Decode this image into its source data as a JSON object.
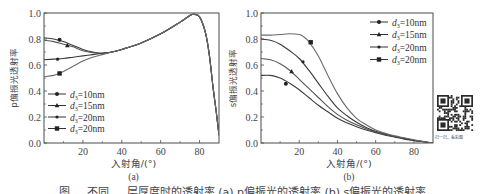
{
  "figure_caption": "图 ... 不同 ... 层厚度时的透射率 (a) p偏振光的透射率 (b) s偏振光的透射率",
  "qr": {
    "caption": "扫一扫，看彩图"
  },
  "chart_data": [
    {
      "type": "line",
      "panel_label": "(a)",
      "title": "",
      "xlabel": "入射角/(°)",
      "ylabel": "p偏振光透射率",
      "xlim": [
        0,
        90
      ],
      "ylim": [
        0,
        1.0
      ],
      "xticks": [
        20,
        40,
        60,
        80
      ],
      "yticks": [
        0.0,
        0.2,
        0.4,
        0.6,
        0.8,
        1.0
      ],
      "ytick_labels": [
        "0.0",
        "0.2",
        "0.4",
        "0.6",
        "0.8",
        "1.0"
      ],
      "grid": false,
      "legend_position": "lower-left",
      "series": [
        {
          "name": "d3=10nm",
          "legend_sub": "3",
          "legend_value": "=10nm",
          "marker": "circle",
          "x": [
            0,
            5,
            10,
            15,
            20,
            25,
            30,
            35,
            40,
            50,
            60,
            70,
            75,
            77,
            80,
            83,
            85,
            87,
            88.5,
            90
          ],
          "y": [
            0.81,
            0.8,
            0.78,
            0.75,
            0.72,
            0.7,
            0.69,
            0.7,
            0.72,
            0.77,
            0.84,
            0.93,
            0.98,
            0.99,
            0.97,
            0.85,
            0.68,
            0.42,
            0.25,
            0.06
          ],
          "marker_at": [
            8,
            0.795
          ]
        },
        {
          "name": "d3=15nm",
          "legend_sub": "3",
          "legend_value": "=15nm",
          "marker": "triangle",
          "x": [
            0,
            5,
            10,
            15,
            20,
            25,
            30,
            35,
            40,
            50,
            60,
            70,
            75,
            77,
            80,
            83,
            85,
            87,
            88.5,
            90
          ],
          "y": [
            0.79,
            0.78,
            0.76,
            0.74,
            0.71,
            0.695,
            0.69,
            0.7,
            0.72,
            0.77,
            0.84,
            0.93,
            0.98,
            0.99,
            0.97,
            0.85,
            0.68,
            0.42,
            0.25,
            0.06
          ],
          "marker_at": [
            12,
            0.75
          ]
        },
        {
          "name": "d3=20nm",
          "legend_sub": "3",
          "legend_value": "=20nm",
          "marker": "dot",
          "x": [
            0,
            5,
            10,
            15,
            20,
            25,
            30,
            35,
            40,
            50,
            60,
            70,
            75,
            77,
            80,
            83,
            85,
            87,
            88.5,
            90
          ],
          "y": [
            0.64,
            0.645,
            0.65,
            0.66,
            0.67,
            0.68,
            0.69,
            0.7,
            0.72,
            0.77,
            0.84,
            0.93,
            0.98,
            0.99,
            0.97,
            0.85,
            0.68,
            0.42,
            0.25,
            0.06
          ],
          "marker_at": [
            7,
            0.645
          ]
        },
        {
          "name": "d3=20nm",
          "legend_sub": "3",
          "legend_value": "=20nm",
          "marker": "square",
          "x": [
            0,
            5,
            10,
            15,
            20,
            25,
            30,
            35,
            40,
            50,
            60,
            70,
            75,
            77,
            80,
            83,
            85,
            87,
            88.5,
            90
          ],
          "y": [
            0.51,
            0.52,
            0.55,
            0.59,
            0.63,
            0.66,
            0.68,
            0.7,
            0.72,
            0.77,
            0.84,
            0.93,
            0.98,
            0.99,
            0.97,
            0.85,
            0.68,
            0.42,
            0.25,
            0.06
          ],
          "marker_at": [
            8,
            0.535
          ]
        }
      ]
    },
    {
      "type": "line",
      "panel_label": "(b)",
      "title": "",
      "xlabel": "入射角/(°)",
      "ylabel": "s偏振光透射率",
      "xlim": [
        0,
        90
      ],
      "ylim": [
        0,
        1.0
      ],
      "xticks": [
        20,
        40,
        60,
        80
      ],
      "yticks": [
        0.0,
        0.2,
        0.4,
        0.6,
        0.8,
        1.0
      ],
      "ytick_labels": [
        "0.0",
        "0.2",
        "0.4",
        "0.6",
        "0.8",
        "1.0"
      ],
      "grid": false,
      "legend_position": "upper-right",
      "series": [
        {
          "name": "d3=10nm",
          "legend_sub": "3",
          "legend_value": "=10nm",
          "marker": "circle",
          "x": [
            0,
            5,
            10,
            15,
            20,
            25,
            30,
            35,
            40,
            45,
            50,
            55,
            60,
            65,
            70,
            75,
            80,
            85,
            90
          ],
          "y": [
            0.52,
            0.52,
            0.5,
            0.46,
            0.41,
            0.35,
            0.29,
            0.24,
            0.19,
            0.155,
            0.125,
            0.1,
            0.08,
            0.06,
            0.045,
            0.03,
            0.02,
            0.01,
            0.0
          ],
          "marker_at": [
            13,
            0.455
          ]
        },
        {
          "name": "d3=15nm",
          "legend_sub": "3",
          "legend_value": "=15nm",
          "marker": "triangle",
          "x": [
            0,
            5,
            10,
            15,
            20,
            25,
            30,
            35,
            40,
            45,
            50,
            55,
            60,
            65,
            70,
            75,
            80,
            85,
            90
          ],
          "y": [
            0.65,
            0.64,
            0.61,
            0.56,
            0.49,
            0.42,
            0.35,
            0.28,
            0.22,
            0.175,
            0.14,
            0.11,
            0.085,
            0.065,
            0.05,
            0.035,
            0.02,
            0.01,
            0.0
          ],
          "marker_at": [
            16,
            0.55
          ]
        },
        {
          "name": "d3=20nm",
          "legend_sub": "3",
          "legend_value": "=20nm",
          "marker": "dot",
          "x": [
            0,
            5,
            10,
            15,
            20,
            25,
            30,
            35,
            40,
            45,
            50,
            55,
            60,
            65,
            70,
            75,
            80,
            85,
            90
          ],
          "y": [
            0.8,
            0.79,
            0.76,
            0.71,
            0.65,
            0.56,
            0.46,
            0.36,
            0.27,
            0.21,
            0.16,
            0.12,
            0.09,
            0.07,
            0.05,
            0.035,
            0.02,
            0.01,
            0.0
          ],
          "marker_at": [
            22,
            0.625
          ]
        },
        {
          "name": "d3=20nm",
          "legend_sub": "3",
          "legend_value": "=20nm",
          "marker": "square",
          "x": [
            0,
            5,
            10,
            15,
            20,
            22,
            25,
            30,
            35,
            40,
            45,
            50,
            55,
            60,
            65,
            70,
            75,
            80,
            85,
            90
          ],
          "y": [
            0.83,
            0.83,
            0.835,
            0.84,
            0.835,
            0.82,
            0.78,
            0.67,
            0.52,
            0.38,
            0.27,
            0.19,
            0.14,
            0.1,
            0.075,
            0.055,
            0.04,
            0.025,
            0.012,
            0.0
          ],
          "marker_at": [
            26,
            0.775
          ]
        }
      ]
    }
  ]
}
